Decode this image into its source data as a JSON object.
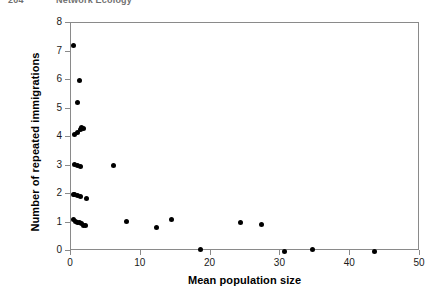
{
  "header": {
    "page_number": "204",
    "book_title": "Network Ecology"
  },
  "chart_data": {
    "type": "scatter",
    "title": "",
    "xlabel": "Mean population size",
    "ylabel": "Number of repeated immigrations",
    "xlim": [
      0,
      50
    ],
    "ylim": [
      0,
      8
    ],
    "xticks": [
      0,
      10,
      20,
      30,
      40,
      50
    ],
    "yticks": [
      0,
      1,
      2,
      3,
      4,
      5,
      6,
      7,
      8
    ],
    "xtick_labels": [
      "0",
      "10",
      "20",
      "30",
      "40",
      "50"
    ],
    "ytick_labels": [
      "0",
      "1",
      "2",
      "3",
      "4",
      "5",
      "6",
      "7",
      "8"
    ],
    "grid": false,
    "legend": null,
    "marker": {
      "shape": "circle",
      "color": "#000000",
      "size": 5
    },
    "series": [
      {
        "name": "populations",
        "points": [
          [
            0.3,
            7.2
          ],
          [
            1.15,
            6.0
          ],
          [
            0.86,
            5.2
          ],
          [
            0.43,
            4.1
          ],
          [
            1.0,
            4.15
          ],
          [
            1.29,
            4.25
          ],
          [
            1.57,
            4.35
          ],
          [
            1.86,
            4.3
          ],
          [
            0.43,
            3.05
          ],
          [
            1.0,
            3.0
          ],
          [
            1.43,
            2.95
          ],
          [
            6.16,
            3.0
          ],
          [
            0.29,
            2.0
          ],
          [
            0.57,
            2.0
          ],
          [
            0.86,
            1.95
          ],
          [
            1.43,
            1.9
          ],
          [
            2.15,
            1.85
          ],
          [
            0.36,
            1.1
          ],
          [
            0.64,
            1.05
          ],
          [
            0.93,
            1.0
          ],
          [
            1.22,
            1.0
          ],
          [
            1.5,
            0.95
          ],
          [
            1.79,
            0.9
          ],
          [
            2.08,
            0.88
          ],
          [
            7.88,
            1.05
          ],
          [
            12.18,
            0.82
          ],
          [
            14.33,
            1.12
          ],
          [
            18.62,
            0.05
          ],
          [
            24.35,
            1.0
          ],
          [
            27.36,
            0.92
          ],
          [
            30.52,
            0.0
          ],
          [
            34.53,
            0.05
          ],
          [
            43.55,
            0.0
          ]
        ]
      }
    ]
  }
}
